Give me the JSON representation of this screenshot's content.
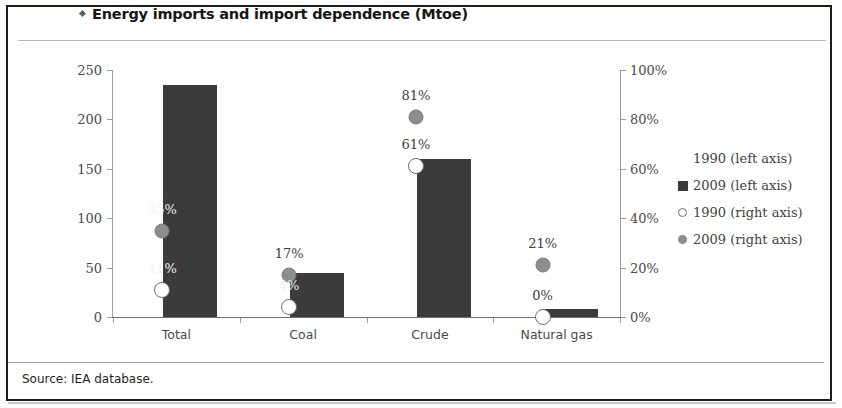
{
  "figure": {
    "title": "Energy imports and import dependence (Mtoe)",
    "title_bullet": "diamond-bullet-icon",
    "source": "Source: IEA database."
  },
  "legend": {
    "position": "right",
    "items": [
      {
        "label": "1990 (left axis)",
        "marker": "none",
        "color": "#ffffff"
      },
      {
        "label": "2009 (left axis)",
        "marker": "square",
        "color": "#3b3b3b"
      },
      {
        "label": "1990 (right axis)",
        "marker": "open-circle",
        "color": "#ffffff"
      },
      {
        "label": "2009 (right axis)",
        "marker": "filled-circle",
        "color": "#8d8d8d"
      }
    ]
  },
  "chart_data": {
    "type": "bar",
    "title": "Energy imports and import dependence (Mtoe)",
    "xlabel": "",
    "ylabel": "",
    "y2label": "",
    "categories": [
      "Total",
      "Coal",
      "Crude",
      "Natural gas"
    ],
    "ylim": [
      0,
      250
    ],
    "yticks": [
      0,
      50,
      100,
      150,
      200,
      250
    ],
    "ytick_labels": [
      "0",
      "50",
      "100",
      "150",
      "200",
      "250"
    ],
    "y2lim": [
      0,
      100
    ],
    "y2ticks": [
      0,
      20,
      40,
      60,
      80,
      100
    ],
    "y2tick_labels": [
      "0%",
      "20%",
      "40%",
      "60%",
      "80%",
      "100%"
    ],
    "grid": false,
    "series": [
      {
        "name": "1990 (left axis)",
        "axis": "left",
        "type": "bar",
        "values": [
          0,
          0,
          0,
          0
        ],
        "color": "#ffffff"
      },
      {
        "name": "2009 (left axis)",
        "axis": "left",
        "type": "bar",
        "values": [
          235,
          45,
          160,
          8
        ],
        "color": "#3b3b3b"
      },
      {
        "name": "1990 (right axis)",
        "axis": "right",
        "type": "scatter",
        "marker": "open-circle",
        "values": [
          11,
          4,
          61,
          0
        ],
        "labels": [
          "11%",
          "4%",
          "61%",
          "0%"
        ],
        "color": "#ffffff"
      },
      {
        "name": "2009 (right axis)",
        "axis": "right",
        "type": "scatter",
        "marker": "filled-circle",
        "values": [
          35,
          17,
          81,
          21
        ],
        "labels": [
          "35%",
          "17%",
          "81%",
          "21%"
        ],
        "color": "#8d8d8d"
      }
    ]
  }
}
